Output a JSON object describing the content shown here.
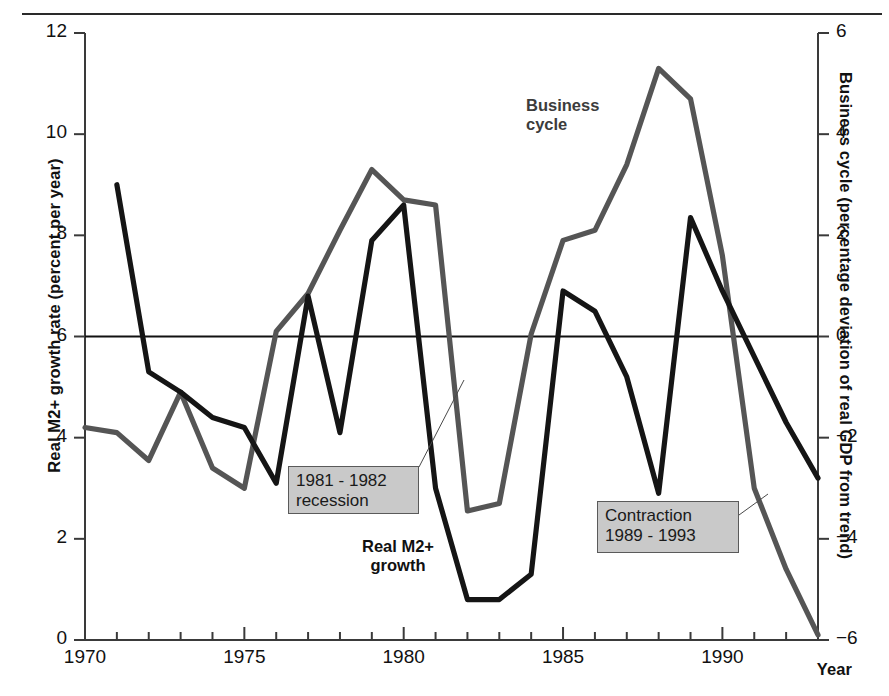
{
  "figure": {
    "x_axis_title": "Year",
    "y_axis_left_title": "Real M2+ growth rate (percent per year)",
    "y_axis_right_title": "Business cycle (percentage deviation of real GDP from trend)"
  },
  "series_labels": {
    "business_cycle_line1": "Business",
    "business_cycle_line2": "cycle",
    "real_m2_line1": "Real M2+",
    "real_m2_line2": "growth"
  },
  "callouts": {
    "recession_line1": "1981 - 1982",
    "recession_line2": "recession",
    "contraction_line1": "Contraction",
    "contraction_line2": "1989 - 1993"
  },
  "ticks": {
    "left": [
      "12",
      "10",
      "8",
      "6",
      "4",
      "2",
      "0"
    ],
    "right": [
      "6",
      "4",
      "2",
      "0",
      "−2",
      "−4",
      "−6"
    ],
    "x": [
      "1970",
      "1975",
      "1980",
      "1985",
      "1990"
    ]
  },
  "colors": {
    "real_m2_line": "#151515",
    "business_cycle_line": "#555555",
    "zero_rule": "#111111",
    "axis": "#3a3a3a",
    "callout_fill": "#c9c9c9",
    "callout_border": "#5a5a5a",
    "background": "#ffffff"
  },
  "chart_data": {
    "type": "line",
    "title": "",
    "xlabel": "Year",
    "ylabel": "Real M2+ growth rate (percent per year)",
    "ylabel_secondary": "Business cycle (percentage deviation of real GDP from trend)",
    "xlim": [
      1970,
      1993
    ],
    "ylim": [
      0,
      12
    ],
    "ylim_secondary": [
      -6,
      6
    ],
    "xticks": [
      1970,
      1975,
      1980,
      1985,
      1990
    ],
    "yticks": [
      0,
      2,
      4,
      6,
      8,
      10,
      12
    ],
    "yticks_secondary": [
      -6,
      -4,
      -2,
      0,
      2,
      4,
      6
    ],
    "grid": false,
    "legend": "inline-annotations",
    "reference_line": {
      "left_axis_value": 6,
      "right_axis_value": 0
    },
    "series": [
      {
        "name": "Real M2+ growth",
        "axis": "left",
        "units": "percent per year",
        "color": "#151515",
        "x": [
          1971,
          1972,
          1973,
          1974,
          1975,
          1976,
          1977,
          1978,
          1979,
          1980,
          1981,
          1982,
          1983,
          1984,
          1985,
          1986,
          1987,
          1988,
          1989,
          1990,
          1991,
          1992,
          1993
        ],
        "values": [
          9.0,
          5.3,
          4.9,
          4.4,
          4.2,
          3.1,
          6.8,
          4.1,
          7.9,
          8.6,
          3.0,
          0.8,
          0.8,
          1.3,
          6.9,
          6.5,
          5.2,
          2.9,
          8.35,
          6.9,
          5.6,
          4.3,
          3.2
        ]
      },
      {
        "name": "Business cycle",
        "axis": "right",
        "units": "percentage deviation of real GDP from trend",
        "color": "#555555",
        "x": [
          1970,
          1971,
          1972,
          1973,
          1974,
          1975,
          1976,
          1977,
          1978,
          1979,
          1980,
          1981,
          1982,
          1983,
          1984,
          1985,
          1986,
          1987,
          1988,
          1989,
          1990,
          1991,
          1992,
          1993
        ],
        "values_right_axis": [
          -1.8,
          -1.9,
          -2.25,
          -1.0,
          -2.4,
          -3.0,
          0.1,
          0.85,
          2.1,
          3.3,
          2.7,
          2.6,
          -3.45,
          -3.3,
          0.05,
          1.9,
          2.1,
          3.4,
          5.3,
          4.7,
          1.6,
          -3.0,
          -4.6,
          -5.9
        ],
        "values_on_left_scale": [
          4.2,
          4.1,
          3.55,
          4.9,
          3.4,
          3.0,
          6.1,
          6.85,
          8.1,
          9.3,
          8.7,
          8.6,
          2.55,
          2.7,
          6.05,
          7.9,
          8.1,
          9.4,
          11.3,
          10.7,
          7.6,
          3.0,
          1.4,
          0.1
        ]
      }
    ],
    "annotations": [
      {
        "text": "1981 - 1982 recession",
        "points_to_year": 1983,
        "series": "Real M2+ growth"
      },
      {
        "text": "Contraction 1989 - 1993",
        "points_to_year": 1991,
        "series": "Business cycle"
      },
      {
        "text": "Business cycle",
        "type": "series-label"
      },
      {
        "text": "Real M2+ growth",
        "type": "series-label"
      }
    ]
  }
}
